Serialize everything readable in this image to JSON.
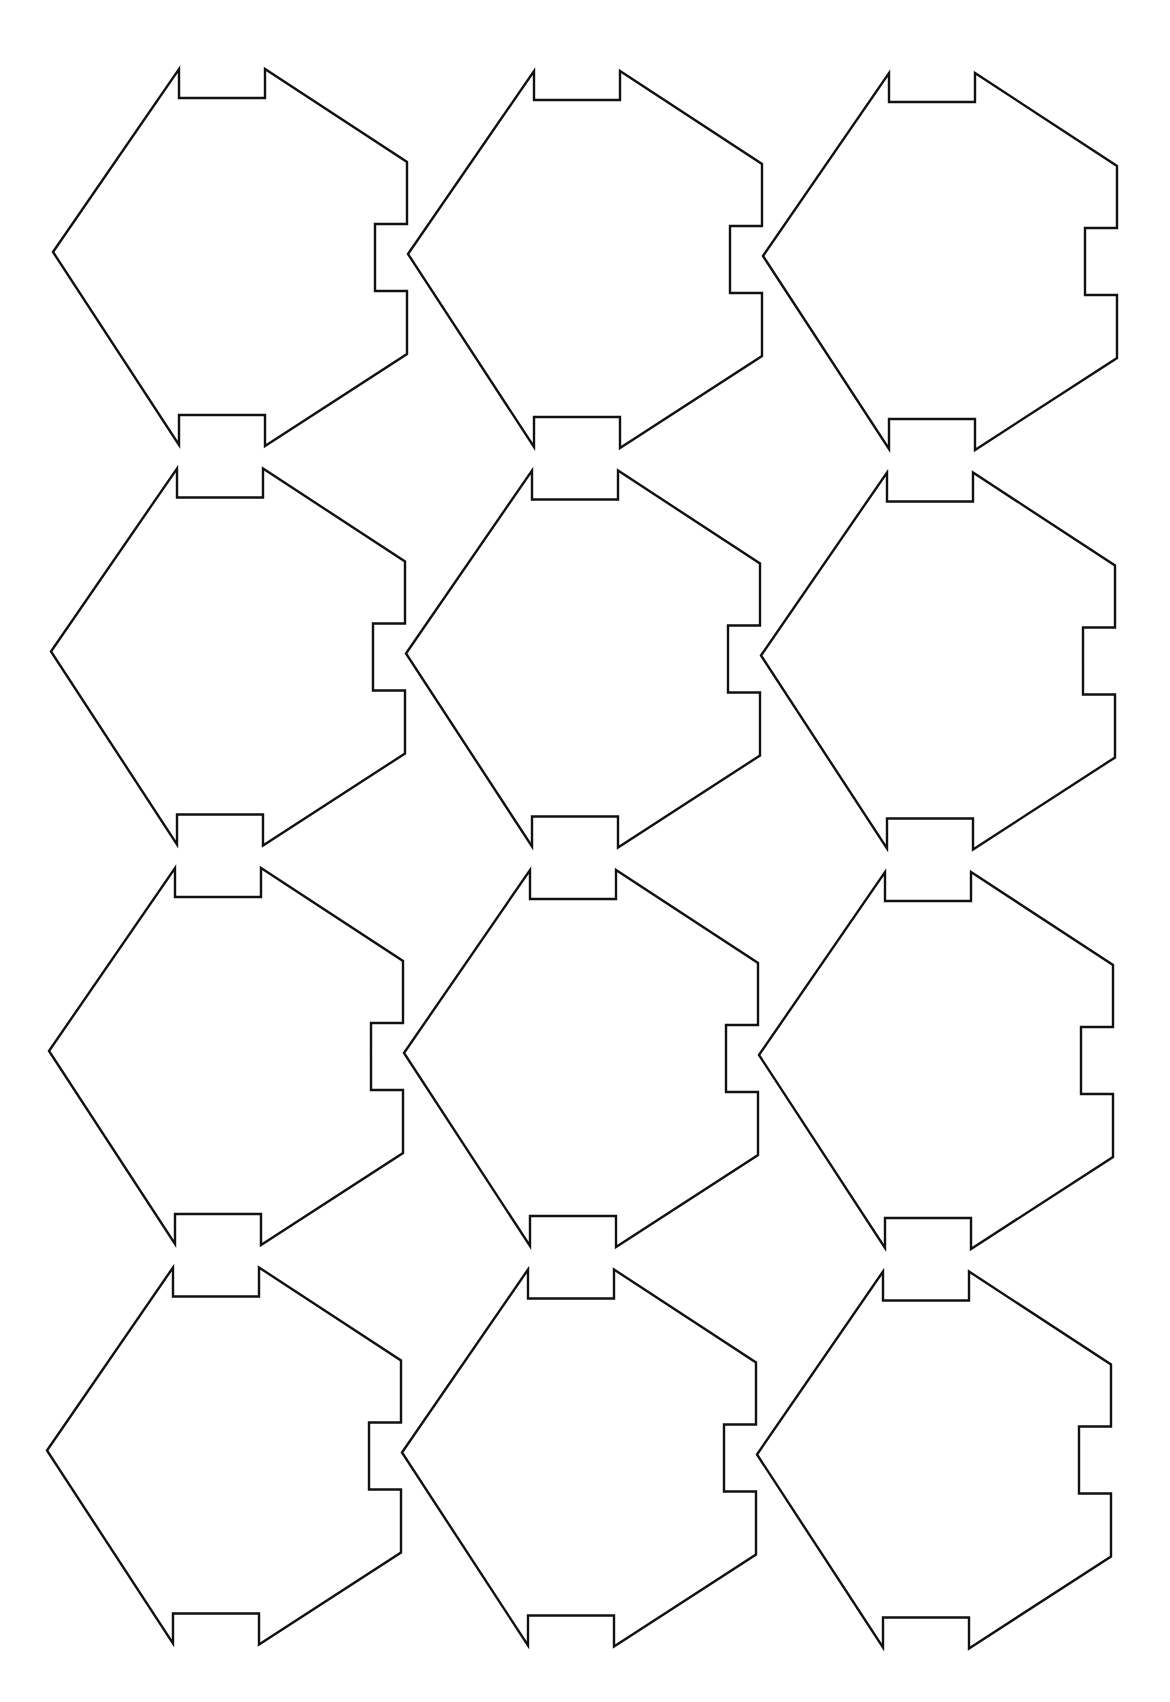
{
  "page": {
    "background": "#ffffff",
    "stroke_color": "#111111"
  },
  "grid": {
    "columns": 3,
    "rows": 4,
    "origin_tip": [
      53,
      252
    ],
    "col_step": [
      355,
      2
    ],
    "row_step": [
      -2,
      399.5
    ]
  },
  "piece_shape": {
    "local_points": [
      [
        0,
        0
      ],
      [
        126,
        -183
      ],
      [
        126,
        -154
      ],
      [
        212,
        -154
      ],
      [
        212,
        -183
      ],
      [
        354,
        -90
      ],
      [
        354,
        -28
      ],
      [
        322,
        -28
      ],
      [
        322,
        39
      ],
      [
        354,
        39
      ],
      [
        354,
        102
      ],
      [
        212,
        194
      ],
      [
        212,
        163
      ],
      [
        126,
        163
      ],
      [
        126,
        193
      ]
    ]
  },
  "pieces": [
    {
      "row": 1,
      "col": 1
    },
    {
      "row": 1,
      "col": 2
    },
    {
      "row": 1,
      "col": 3
    },
    {
      "row": 2,
      "col": 1
    },
    {
      "row": 2,
      "col": 2
    },
    {
      "row": 2,
      "col": 3
    },
    {
      "row": 3,
      "col": 1
    },
    {
      "row": 3,
      "col": 2
    },
    {
      "row": 3,
      "col": 3
    },
    {
      "row": 4,
      "col": 1
    },
    {
      "row": 4,
      "col": 2
    },
    {
      "row": 4,
      "col": 3
    }
  ]
}
